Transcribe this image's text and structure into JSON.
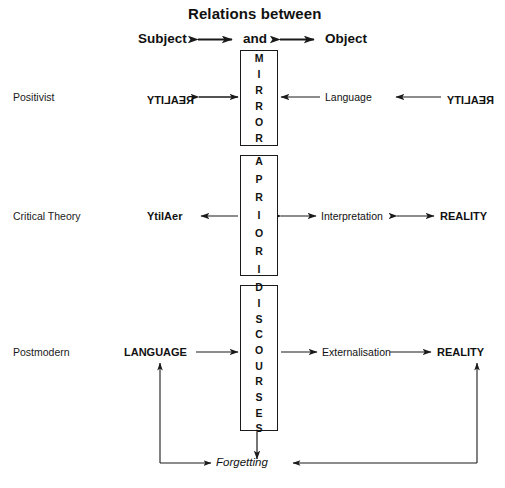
{
  "title": "Relations between",
  "header": {
    "left": "Subject",
    "middle": "and",
    "right": "Object"
  },
  "rows": [
    {
      "label": "Positivist",
      "left_node": "REALITY",
      "left_node_rendering": "mirror-image",
      "box": "MIRROR",
      "mid_node": "Language",
      "right_node": "REALITY",
      "right_node_rendering": "mirror-image"
    },
    {
      "label": "Critical Theory",
      "left_node": "YtilAer",
      "left_node_rendering": "letters-reversed",
      "box": "A PRIORI",
      "mid_node": "Interpretation",
      "right_node": "REALITY",
      "right_node_rendering": "normal"
    },
    {
      "label": "Postmodern",
      "left_node": "LANGUAGE",
      "left_node_rendering": "normal",
      "box": "DISCOURSES",
      "mid_node": "Externalisation",
      "right_node": "REALITY",
      "right_node_rendering": "normal"
    }
  ],
  "feedback": {
    "label": "Forgetting"
  },
  "boxes": {
    "mirror_letters": [
      "M",
      "I",
      "R",
      "R",
      "O",
      "R"
    ],
    "apriori_letters": [
      "A",
      "P",
      "R",
      "I",
      "O",
      "R",
      "I"
    ],
    "discourses_letters": [
      "D",
      "I",
      "S",
      "C",
      "O",
      "U",
      "R",
      "S",
      "E",
      "S"
    ]
  },
  "colors": {
    "ink": "#1a1a1a",
    "background": "#ffffff"
  }
}
